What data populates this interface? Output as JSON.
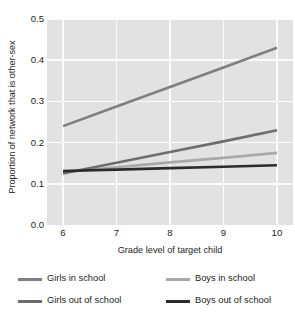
{
  "chart_data": {
    "type": "line",
    "title": "",
    "xlabel": "Grade level of target child",
    "ylabel": "Proportion of network that is other-sex",
    "x": [
      6,
      7,
      8,
      9,
      10
    ],
    "xtick_labels": [
      "6",
      "7",
      "8",
      "9",
      "10"
    ],
    "ytick_labels": [
      "0.0",
      "0.1",
      "0.2",
      "0.3",
      "0.4",
      "0.5"
    ],
    "ytick_values": [
      0.0,
      0.1,
      0.2,
      0.3,
      0.4,
      0.5
    ],
    "xlim": [
      5.7,
      10.3
    ],
    "ylim": [
      0.0,
      0.5
    ],
    "grid": true,
    "legend_position": "below",
    "plot_background": "#e2e2e2",
    "gridline_color": "#fbfbfb",
    "series": [
      {
        "name": "Girls in school",
        "color": "#807f80",
        "values": [
          0.24,
          0.2875,
          0.335,
          0.3825,
          0.43
        ]
      },
      {
        "name": "Boys in school",
        "color": "#a8a8a8",
        "values": [
          0.128,
          0.14,
          0.152,
          0.163,
          0.175
        ]
      },
      {
        "name": "Girls out of school",
        "color": "#6e6d6e",
        "values": [
          0.125,
          0.151,
          0.177,
          0.203,
          0.23
        ]
      },
      {
        "name": "Boys out of school",
        "color": "#2b2b2b",
        "values": [
          0.131,
          0.1345,
          0.138,
          0.1415,
          0.145
        ]
      }
    ]
  },
  "legend": {
    "items": [
      {
        "label": "Girls in school"
      },
      {
        "label": "Boys in school"
      },
      {
        "label": "Girls out of school"
      },
      {
        "label": "Boys out of school"
      }
    ]
  }
}
